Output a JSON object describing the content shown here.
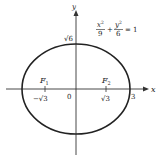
{
  "diagram": {
    "equation": {
      "term1_num": "x",
      "term1_exp": "2",
      "term1_den": "9",
      "plus": "+",
      "term2_num": "y",
      "term2_exp": "2",
      "term2_den": "6",
      "equals": "= 1"
    },
    "axes": {
      "x_label": "x",
      "y_label": "y",
      "origin_label": "0"
    },
    "labels": {
      "y_intercept": "√6",
      "x_intercept": "3",
      "focus1": "F",
      "focus1_sub": "1",
      "focus2": "F",
      "focus2_sub": "2",
      "focus1_x": "−√3",
      "focus2_x": "√3"
    },
    "colors": {
      "curve": "#222222",
      "axis": "#333333",
      "background": "#ffffff"
    }
  }
}
